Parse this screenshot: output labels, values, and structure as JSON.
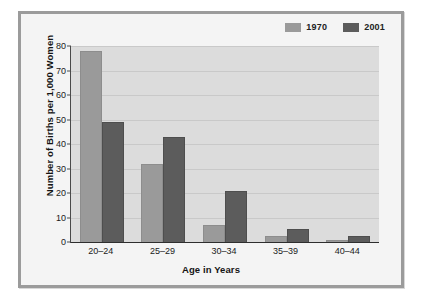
{
  "chart_data": {
    "type": "bar",
    "title": "",
    "xlabel": "Age in Years",
    "ylabel": "Number of Births per 1,000 Women",
    "categories": [
      "20–24",
      "25–29",
      "30–34",
      "35–39",
      "40–44"
    ],
    "series": [
      {
        "name": "1970",
        "color": "#9a9a9a",
        "values": [
          78,
          32,
          7,
          2.5,
          1
        ]
      },
      {
        "name": "2001",
        "color": "#5c5c5c",
        "values": [
          49,
          43,
          21,
          5.5,
          2.5
        ]
      }
    ],
    "ylim": [
      0,
      80
    ],
    "ytick_values": [
      80,
      70,
      60,
      50,
      40,
      30,
      20,
      10,
      0
    ],
    "ytick_labels": [
      "80",
      "70",
      "60",
      "50",
      "40",
      "30",
      "20",
      "10",
      "0"
    ],
    "grid": true,
    "legend_position": "top-right",
    "plot_background": "#dcdcdc",
    "figure_background": "#f4f4f4",
    "frame_color": "#9b9b9b",
    "axis_color": "#2e2e2e"
  }
}
